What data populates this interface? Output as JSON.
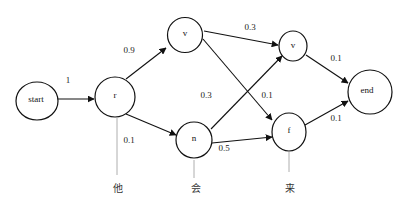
{
  "diagram": {
    "type": "lattice / HMM state graph",
    "nodes": [
      {
        "id": "start",
        "label": "start"
      },
      {
        "id": "r",
        "label": "r"
      },
      {
        "id": "v1",
        "label": "v"
      },
      {
        "id": "n",
        "label": "n"
      },
      {
        "id": "v2",
        "label": "v"
      },
      {
        "id": "f",
        "label": "f"
      },
      {
        "id": "end",
        "label": "end"
      }
    ],
    "edges": [
      {
        "from": "start",
        "to": "r",
        "label": "1"
      },
      {
        "from": "r",
        "to": "v1",
        "label": "0.9"
      },
      {
        "from": "r",
        "to": "n",
        "label": "0.1"
      },
      {
        "from": "v1",
        "to": "v2",
        "label": "0.3"
      },
      {
        "from": "v1",
        "to": "f",
        "label": "0.1"
      },
      {
        "from": "n",
        "to": "v2",
        "label": "0.3"
      },
      {
        "from": "n",
        "to": "f",
        "label": "0.5"
      },
      {
        "from": "v2",
        "to": "end",
        "label": "0.1"
      },
      {
        "from": "f",
        "to": "end",
        "label": "0.1"
      }
    ],
    "words": [
      {
        "attached_to": "r",
        "label": "他"
      },
      {
        "attached_to": "n",
        "label": "会"
      },
      {
        "attached_to": "f",
        "label": "来"
      }
    ]
  }
}
